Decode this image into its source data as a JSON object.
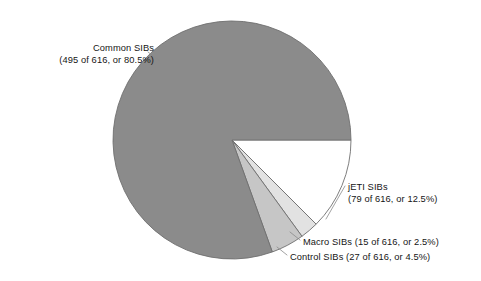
{
  "chart_data": {
    "type": "pie",
    "title": "",
    "subtitle": "",
    "xlabel": "",
    "ylabel": "",
    "total": 616,
    "units": "SIBs",
    "legend_position": "none",
    "grid": false,
    "start_angle_deg": 0,
    "direction": "clockwise",
    "categories": [
      "jETI SIBs",
      "Macro SIBs",
      "Control SIBs",
      "Common SIBs"
    ],
    "values": [
      79,
      15,
      27,
      495
    ],
    "percentages": [
      12.5,
      2.5,
      4.5,
      80.5
    ],
    "slices": [
      {
        "name": "jETI SIBs",
        "value": 79,
        "percent": 12.5,
        "color": "#ffffff",
        "stroke": "#6f6f6f",
        "label_name": "jETI SIBs",
        "label_detail": "(79 of 616, or 12.5%)"
      },
      {
        "name": "Macro SIBs",
        "value": 15,
        "percent": 2.5,
        "color": "#e2e2e2",
        "stroke": "#6f6f6f",
        "label_name": "Macro SIBs",
        "label_detail": "(15 of 616, or 2.5%)",
        "label_combined": "Macro SIBs (15 of 616, or 2.5%)"
      },
      {
        "name": "Control SIBs",
        "value": 27,
        "percent": 4.5,
        "color": "#c6c6c6",
        "stroke": "#6f6f6f",
        "label_name": "Control SIBs",
        "label_detail": "(27 of 616, or 4.5%)",
        "label_combined": "Control SIBs (27 of 616, or 4.5%)"
      },
      {
        "name": "Common SIBs",
        "value": 495,
        "percent": 80.5,
        "color": "#8b8b8b",
        "stroke": "#6f6f6f",
        "label_name": "Common SIBs",
        "label_detail": "(495 of 616, or 80.5%)"
      }
    ]
  },
  "labels": {
    "common": {
      "line1": "Common SIBs",
      "line2": "(495 of 616, or 80.5%)"
    },
    "jeti": {
      "line1": "jETI SIBs",
      "line2": "(79 of 616, or 12.5%)"
    },
    "macro": {
      "line1": "Macro SIBs (15 of 616, or 2.5%)"
    },
    "control": {
      "line1": "Control SIBs (27 of 616, or 4.5%)"
    }
  },
  "colors": {
    "background": "#ffffff",
    "text": "#151515",
    "slice_common": "#8b8b8b",
    "slice_control": "#c6c6c6",
    "slice_macro": "#e2e2e2",
    "slice_jeti": "#ffffff",
    "outline": "#6f6f6f",
    "leader": "#8a8a8a"
  }
}
